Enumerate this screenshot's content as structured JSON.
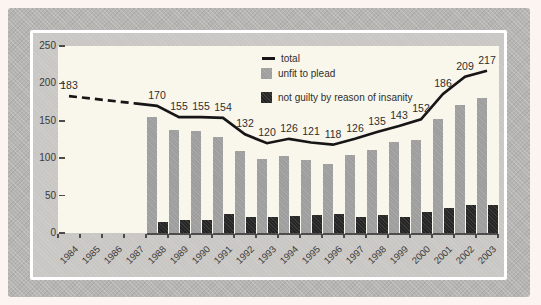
{
  "chart_data": {
    "type": "bar",
    "title": "",
    "categories": [
      "1984",
      "1985",
      "1986",
      "1987",
      "1988",
      "1989",
      "1990",
      "1991",
      "1992",
      "1993",
      "1994",
      "1995",
      "1996",
      "1997",
      "1998",
      "1999",
      "2000",
      "2001",
      "2002",
      "2003"
    ],
    "series": [
      {
        "name": "total",
        "type": "line",
        "color": "#161616",
        "values": [
          183,
          null,
          null,
          null,
          170,
          155,
          155,
          154,
          132,
          120,
          126,
          121,
          118,
          126,
          135,
          143,
          152,
          186,
          209,
          217
        ],
        "dashed_until_category": "1987",
        "data_labels": true
      },
      {
        "name": "unfit to plead",
        "type": "bar",
        "color": "#9d9d9d",
        "values": [
          null,
          null,
          null,
          null,
          155,
          138,
          137,
          129,
          110,
          99,
          103,
          97,
          92,
          104,
          111,
          121,
          124,
          152,
          171,
          180
        ]
      },
      {
        "name": "not guilty by reason of insanity",
        "type": "bar",
        "color": "#242424",
        "values": [
          null,
          null,
          null,
          null,
          15,
          17,
          18,
          25,
          22,
          21,
          23,
          24,
          26,
          22,
          24,
          22,
          28,
          34,
          38,
          37
        ]
      }
    ],
    "ylim": [
      0,
      250
    ],
    "yticks": [
      0,
      50,
      100,
      150,
      200,
      250
    ],
    "grid": false,
    "legend_position": "inside-top-center",
    "x_label_rotation": -45
  },
  "legend": {
    "items": [
      {
        "label": "total",
        "swatch": "line"
      },
      {
        "label": "unfit to plead",
        "swatch": "gray-square"
      },
      {
        "label": "not guilty by reason of insanity",
        "swatch": "black-square"
      }
    ]
  },
  "palette": {
    "outer_margin": "#fbf4f0",
    "frame_gray": "#b7b5b2",
    "panel_gray": "#c9c7c4",
    "plot_background": "#f9f7ec",
    "rim_white": "#ffffff",
    "axis_text": "#3a3a3a",
    "line_black": "#161616",
    "bar_gray": "#9d9d9d",
    "bar_black": "#242424"
  }
}
